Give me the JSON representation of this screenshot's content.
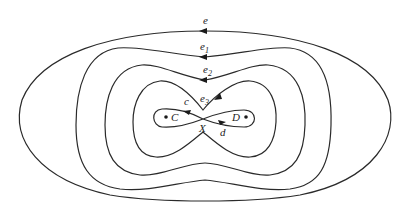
{
  "diagram": {
    "type": "nested closed curves around a figure-eight",
    "curves": [
      {
        "id": "e",
        "label": "e",
        "subscript": ""
      },
      {
        "id": "e1",
        "label": "e",
        "subscript": "1"
      },
      {
        "id": "e2",
        "label": "e",
        "subscript": "2"
      },
      {
        "id": "e3",
        "label": "e",
        "subscript": "3"
      }
    ],
    "figure_eight": {
      "lobe_left_label": "c",
      "lobe_right_label": "d",
      "crossing_label": "X"
    },
    "points": [
      {
        "id": "C",
        "label": "C"
      },
      {
        "id": "D",
        "label": "D"
      }
    ],
    "colors": {
      "stroke": "#2a2a2a",
      "background": "#ffffff"
    }
  }
}
